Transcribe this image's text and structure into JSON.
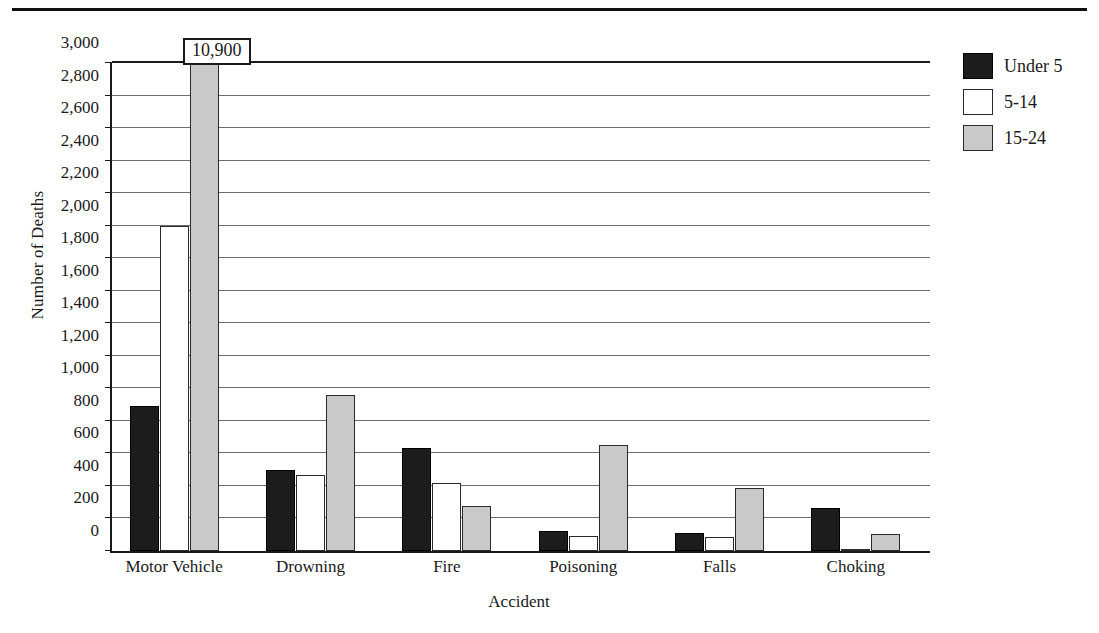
{
  "chart_data": {
    "type": "bar",
    "title": "",
    "xlabel": "Accident",
    "ylabel": "Number of Deaths",
    "categories": [
      "Motor Vehicle",
      "Drowning",
      "Fire",
      "Poisoning",
      "Falls",
      "Choking"
    ],
    "series": [
      {
        "name": "Under 5",
        "color": "#1c1c1c",
        "values": [
          890,
          500,
          635,
          120,
          110,
          265
        ]
      },
      {
        "name": "5-14",
        "color": "#ffffff",
        "values": [
          2000,
          470,
          420,
          90,
          85,
          15
        ]
      },
      {
        "name": "15-24",
        "color": "#c9c9c9",
        "values": [
          10900,
          960,
          275,
          650,
          385,
          105
        ]
      }
    ],
    "ylim": [
      0,
      3000
    ],
    "yticks": [
      0,
      200,
      400,
      600,
      800,
      1000,
      1200,
      1400,
      1600,
      1800,
      2000,
      2200,
      2400,
      2600,
      2800,
      3000
    ],
    "ytick_labels": [
      "0",
      "200",
      "400",
      "600",
      "800",
      "1,000",
      "1,200",
      "1,400",
      "1,600",
      "1,800",
      "2,000",
      "2,200",
      "2,400",
      "2,600",
      "2,800",
      "3,000"
    ],
    "grid": true,
    "legend_position": "right",
    "annotations": [
      {
        "text": "10,900",
        "series": "15-24",
        "category": "Motor Vehicle",
        "note": "value exceeds axis maximum; bar is clipped at 3,000"
      }
    ]
  },
  "legend": {
    "items": [
      {
        "label": "Under 5"
      },
      {
        "label": "5-14"
      },
      {
        "label": "15-24"
      }
    ]
  },
  "callout": {
    "value": "10,900"
  }
}
